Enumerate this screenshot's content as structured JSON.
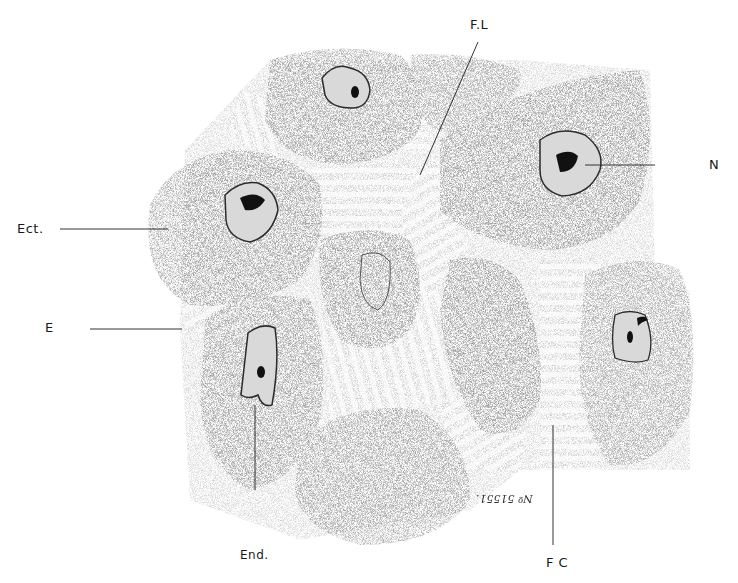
{
  "figure": {
    "type": "histological-illustration",
    "style": "stippled grayscale drawing of epithelial cells with fibrillar connections",
    "colors": {
      "background": "#ffffff",
      "cell_fill": "#a9a9a9",
      "cell_fill_dark": "#8f8f8f",
      "fibril_light": "#d9d9d9",
      "nucleus_outline": "#2b2b2b",
      "chromatin": "#111111",
      "leader_line": "#333333"
    }
  },
  "labels": {
    "fl": "F.L",
    "n": "N",
    "ect": "Ect.",
    "e": "E",
    "end": "End.",
    "fc": "F C",
    "plate_ref": "Nº 51551."
  }
}
